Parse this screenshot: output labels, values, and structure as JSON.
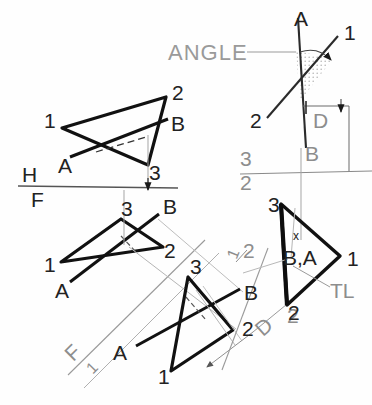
{
  "drawing": {
    "title": "ANGLE",
    "type": "descriptive-geometry-multiview",
    "annotations": {
      "angle_callout": "ANGLE",
      "true_length": "TL",
      "dimension_d": "D",
      "dimension_d2": "D",
      "fold_h": "H",
      "fold_f": "F",
      "fold_3": "3",
      "fold_2": "2",
      "fold_f1_f": "F",
      "fold_f1_1": "1",
      "aux2_mark_1": "1",
      "aux2_mark_2": "2",
      "aux_right_2": "2"
    },
    "views": [
      {
        "name": "top-view",
        "vertices": [
          {
            "label": "1",
            "x": 47,
            "y": 121
          },
          {
            "label": "2",
            "x": 174,
            "y": 91
          },
          {
            "label": "3",
            "x": 148,
            "y": 172
          }
        ],
        "line_labels": [
          {
            "label": "A",
            "x": 60,
            "y": 166
          },
          {
            "label": "B",
            "x": 173,
            "y": 124
          }
        ]
      },
      {
        "name": "front-view",
        "vertices": [
          {
            "label": "1",
            "x": 46,
            "y": 265
          },
          {
            "label": "3",
            "x": 123,
            "y": 209
          },
          {
            "label": "2",
            "x": 166,
            "y": 250
          }
        ],
        "line_labels": [
          {
            "label": "A",
            "x": 57,
            "y": 289
          },
          {
            "label": "B",
            "x": 165,
            "y": 206
          }
        ]
      },
      {
        "name": "auxiliary-view-1",
        "vertices": [
          {
            "label": "3",
            "x": 190,
            "y": 266
          },
          {
            "label": "1",
            "x": 157,
            "y": 376
          },
          {
            "label": "2",
            "x": 243,
            "y": 328
          }
        ],
        "line_labels": [
          {
            "label": "A",
            "x": 115,
            "y": 352
          },
          {
            "label": "B",
            "x": 245,
            "y": 292
          }
        ]
      },
      {
        "name": "auxiliary-view-2-edge",
        "vertices": [
          {
            "label": "3",
            "x": 276,
            "y": 203
          },
          {
            "label": "2",
            "x": 287,
            "y": 312
          },
          {
            "label": "1",
            "x": 348,
            "y": 260
          }
        ],
        "line_labels": [
          {
            "label": "B,A",
            "x": 292,
            "y": 255
          },
          {
            "label": "x",
            "x": 296,
            "y": 240
          }
        ]
      },
      {
        "name": "angle-view",
        "line_labels": [
          {
            "label": "A",
            "x": 297,
            "y": 20
          },
          {
            "label": "1",
            "x": 345,
            "y": 34
          },
          {
            "label": "2",
            "x": 253,
            "y": 120
          },
          {
            "label": "B",
            "x": 307,
            "y": 153
          }
        ]
      }
    ],
    "colors": {
      "ink": "#111111",
      "construction": "#9a9a9a",
      "hatch": "#c9c9c9"
    }
  }
}
